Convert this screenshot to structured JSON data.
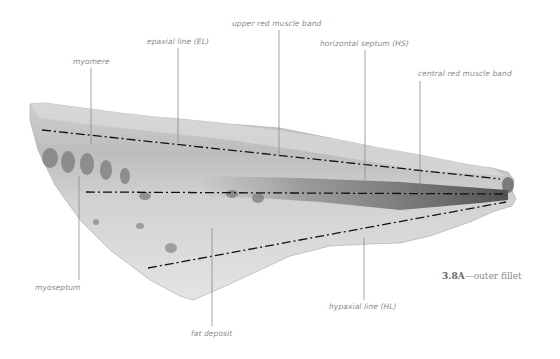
{
  "figure": {
    "caption_number": "3.8A",
    "caption_separator": "—",
    "caption_text": "outer fillet"
  },
  "labels": {
    "myomere": "myomere",
    "epaxial_line": "epaxial line (EL)",
    "upper_red_muscle_band": "upper red muscle band",
    "horizontal_septum": "horizontal septum (HS)",
    "central_red_muscle_band": "central red muscle band",
    "myoseptum": "myoseptum",
    "fat_deposit": "fat deposit",
    "hypaxial_line": "hypaxial line (HL)"
  },
  "colors": {
    "label_text": "#8a8a8a",
    "leader_line": "#8c8c8c",
    "dash_dot_line": "#111111",
    "fillet_light": "#e6e6e6",
    "fillet_mid": "#bdbdbd",
    "fillet_dark": "#555555"
  }
}
